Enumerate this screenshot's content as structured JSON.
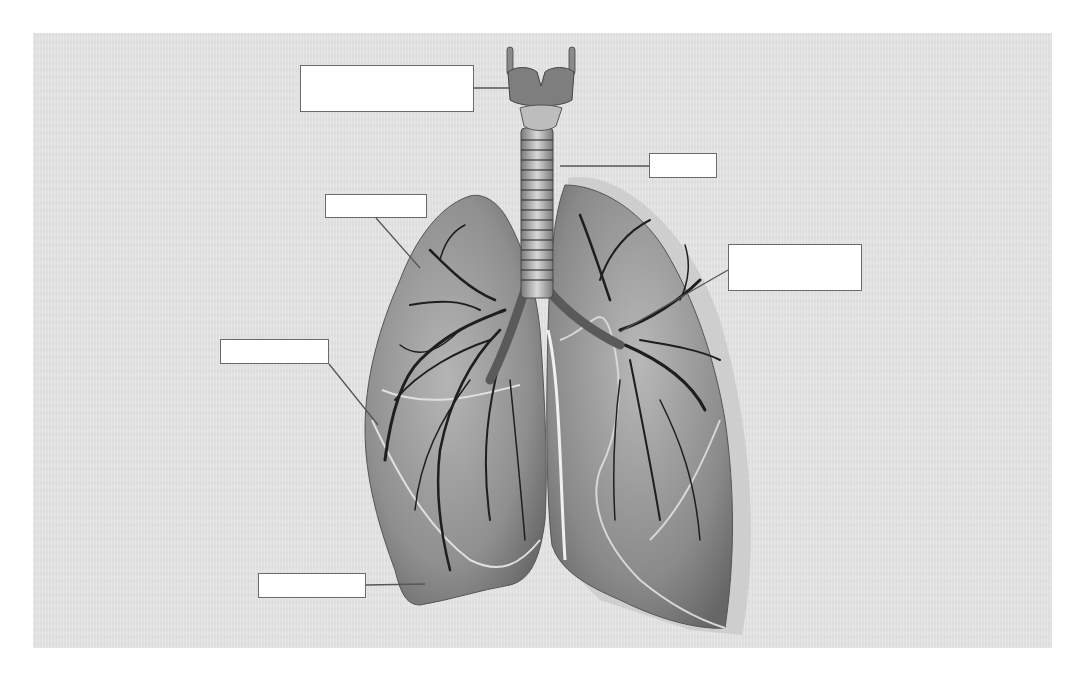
{
  "diagram": {
    "title_cutoff": "",
    "background_color": "#e3e3e3",
    "label_boxes": [
      {
        "id": "larynx",
        "text": "",
        "x": 300,
        "y": 65,
        "w": 174,
        "h": 47,
        "line_to": [
          510,
          88
        ]
      },
      {
        "id": "trachea",
        "text": "",
        "x": 649,
        "y": 153,
        "w": 68,
        "h": 25,
        "line_to": [
          560,
          166
        ]
      },
      {
        "id": "upper-left",
        "text": "",
        "x": 325,
        "y": 194,
        "w": 102,
        "h": 24,
        "line_to": [
          420,
          268
        ]
      },
      {
        "id": "upper-right",
        "text": "",
        "x": 728,
        "y": 244,
        "w": 134,
        "h": 47,
        "line_to": [
          620,
          332
        ]
      },
      {
        "id": "mid-left",
        "text": "",
        "x": 220,
        "y": 339,
        "w": 109,
        "h": 25,
        "line_to": [
          378,
          425
        ]
      },
      {
        "id": "bottom-left",
        "text": "",
        "x": 258,
        "y": 573,
        "w": 108,
        "h": 25,
        "line_to": [
          425,
          584
        ]
      }
    ]
  }
}
